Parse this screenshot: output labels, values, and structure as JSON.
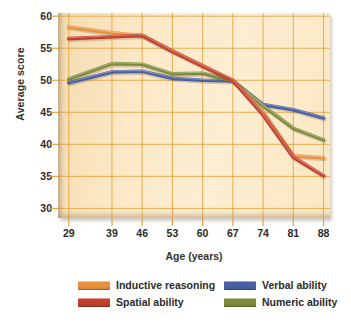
{
  "chart_data": {
    "type": "line",
    "title": "",
    "xlabel": "Age (years)",
    "ylabel": "Average score",
    "grid": true,
    "legend_position": "bottom",
    "x": [
      29,
      39,
      46,
      53,
      60,
      67,
      74,
      81,
      88
    ],
    "x_tick_labels": [
      "29",
      "39",
      "46",
      "53",
      "60",
      "67",
      "74",
      "81",
      "88"
    ],
    "y_tick_labels": [
      "30",
      "35",
      "40",
      "45",
      "50",
      "55",
      "60"
    ],
    "y_ticks": [
      30,
      35,
      40,
      45,
      50,
      55,
      60
    ],
    "ylim": [
      28.5,
      60.5
    ],
    "series": [
      {
        "name": "Inductive reasoning",
        "color": "#e8913f",
        "values": [
          58.3,
          57.4,
          57.0,
          54.6,
          52.3,
          50.0,
          45.0,
          38.2,
          37.9
        ]
      },
      {
        "name": "Spatial ability",
        "color": "#c4402e",
        "values": [
          56.5,
          56.8,
          57.0,
          54.5,
          52.2,
          50.0,
          44.6,
          38.0,
          35.1
        ]
      },
      {
        "name": "Verbal ability",
        "color": "#4a5fa5",
        "values": [
          49.6,
          51.3,
          51.4,
          50.3,
          50.0,
          49.9,
          46.2,
          45.4,
          44.1
        ]
      },
      {
        "name": "Numeric ability",
        "color": "#7d8c3c",
        "values": [
          50.2,
          52.6,
          52.5,
          51.0,
          51.1,
          49.9,
          46.0,
          42.5,
          40.7
        ]
      }
    ]
  },
  "legend": {
    "items": [
      {
        "label": "Inductive reasoning",
        "color": "#e8913f"
      },
      {
        "label": "Spatial ability",
        "color": "#c4402e"
      },
      {
        "label": "Verbal ability",
        "color": "#4a5fa5"
      },
      {
        "label": "Numeric ability",
        "color": "#7d8c3c"
      }
    ]
  },
  "axes": {
    "y_title": "Average score",
    "x_title": "Age (years)"
  },
  "colors": {
    "plot_background": "#fbe8c6",
    "gridline": "#e6a23c",
    "text": "#2b2b2b"
  }
}
